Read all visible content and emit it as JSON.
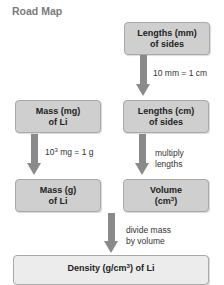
{
  "title": "Road Map",
  "boxes": {
    "lengths_mm": {
      "line1": "Lengths (mm)",
      "line2": "of sides"
    },
    "mass_mg": {
      "line1": "Mass (mg)",
      "line2": "of Li"
    },
    "lengths_cm": {
      "line1": "Lengths (cm)",
      "line2": "of sides"
    },
    "mass_g": {
      "line1": "Mass (g)",
      "line2": "of Li"
    },
    "volume": {
      "line1": "Volume",
      "line2_pre": "(cm",
      "line2_sup": "3",
      "line2_post": ")"
    },
    "density": {
      "pre": "Density (g/cm",
      "sup": "3",
      "post": ") of Li"
    }
  },
  "arrows": {
    "mm_to_cm": {
      "label": "10 mm = 1 cm"
    },
    "mg_to_g": {
      "label_pre": "10",
      "label_sup": "3",
      "label_post": " mg = 1 g"
    },
    "cm_to_volume": {
      "line1": "multiply",
      "line2": "lengths"
    },
    "to_density": {
      "line1": "divide mass",
      "line2": "by volume"
    }
  },
  "colors": {
    "box": "#cfcfcf",
    "box_light": "#ececec",
    "arrow": "#8a8a8a",
    "title": "#7a7a7a"
  }
}
